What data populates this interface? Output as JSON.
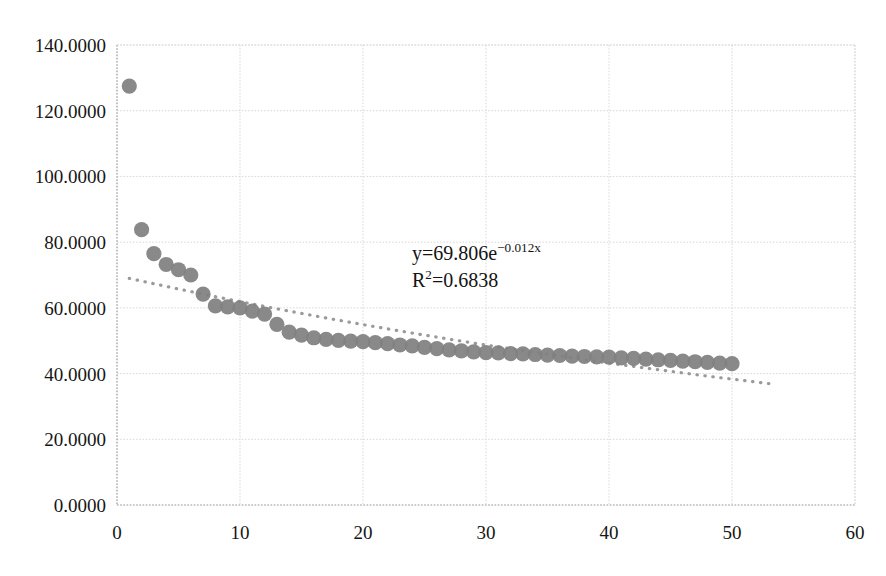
{
  "chart_data": {
    "type": "scatter",
    "title": "",
    "subtitle": "",
    "xlabel": "",
    "ylabel": "",
    "xlim": [
      0,
      60
    ],
    "ylim": [
      0,
      140
    ],
    "grid": true,
    "legend": null,
    "x_ticks": [
      "0",
      "10",
      "20",
      "30",
      "40",
      "50",
      "60"
    ],
    "x_tick_values": [
      0,
      10,
      20,
      30,
      40,
      50,
      60
    ],
    "y_ticks": [
      "0.0000",
      "20.0000",
      "40.0000",
      "60.0000",
      "80.0000",
      "100.0000",
      "120.0000",
      "140.0000"
    ],
    "y_tick_values": [
      0,
      20,
      40,
      60,
      80,
      100,
      120,
      140
    ],
    "series": [
      {
        "name": "data",
        "marker": "circle",
        "color": "#808080",
        "x": [
          1,
          2,
          3,
          4,
          5,
          6,
          7,
          8,
          9,
          10,
          11,
          12,
          13,
          14,
          15,
          16,
          17,
          18,
          19,
          20,
          21,
          22,
          23,
          24,
          25,
          26,
          27,
          28,
          29,
          30,
          31,
          32,
          33,
          34,
          35,
          36,
          37,
          38,
          39,
          40,
          41,
          42,
          43,
          44,
          45,
          46,
          47,
          48,
          49,
          50
        ],
        "y": [
          127.5,
          83.8,
          76.5,
          73.2,
          71.6,
          70.0,
          64.2,
          60.6,
          60.3,
          60.0,
          59.0,
          58.1,
          55.0,
          52.6,
          51.7,
          50.9,
          50.4,
          50.1,
          49.9,
          49.7,
          49.4,
          49.1,
          48.7,
          48.4,
          48.0,
          47.6,
          47.2,
          46.9,
          46.6,
          46.4,
          46.3,
          46.1,
          46.0,
          45.8,
          45.6,
          45.5,
          45.3,
          45.2,
          45.1,
          45.0,
          44.8,
          44.6,
          44.4,
          44.2,
          44.0,
          43.8,
          43.6,
          43.4,
          43.2,
          43.0
        ]
      }
    ],
    "trendline": {
      "name": "exponential-fit",
      "type": "exponential",
      "style": "dotted",
      "color": "#9a9a9a",
      "coefficient": 69.806,
      "exponent": -0.012,
      "x_start": 1,
      "x_end": 53,
      "r_squared": 0.6838
    },
    "annotations": {
      "equation_prefix": "y=69.806e",
      "equation_exponent": "−0.012x",
      "r_squared_prefix": "R",
      "r_squared_superscript": "2",
      "r_squared_value": "=0.6838"
    }
  },
  "colors": {
    "marker": "#808080",
    "trendline": "#9a9a9a",
    "gridline": "#d9d9d9",
    "axis": "#a6a6a6",
    "text": "#161616",
    "background": "#ffffff"
  }
}
